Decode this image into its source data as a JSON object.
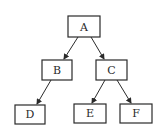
{
  "diagram": {
    "type": "tree",
    "nodes": [
      {
        "id": "A",
        "label": "A"
      },
      {
        "id": "B",
        "label": "B"
      },
      {
        "id": "C",
        "label": "C"
      },
      {
        "id": "D",
        "label": "D"
      },
      {
        "id": "E",
        "label": "E"
      },
      {
        "id": "F",
        "label": "F"
      }
    ],
    "edges": [
      {
        "from": "A",
        "to": "B"
      },
      {
        "from": "A",
        "to": "C"
      },
      {
        "from": "B",
        "to": "D"
      },
      {
        "from": "C",
        "to": "E"
      },
      {
        "from": "C",
        "to": "F"
      }
    ],
    "colors": {
      "stroke": "#2a2a2a",
      "fill": "#ffffff"
    }
  }
}
